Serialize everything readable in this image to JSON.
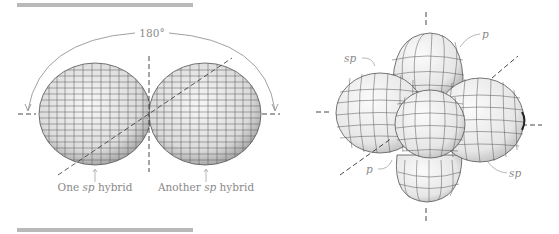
{
  "left_figure": {
    "angle_label": "180°",
    "labels": [
      {
        "prefix": "One ",
        "italic": "sp",
        "suffix": " hybrid"
      },
      {
        "prefix": "Another ",
        "italic": "sp",
        "suffix": " hybrid"
      }
    ]
  },
  "right_figure": {
    "labels": [
      {
        "text": "p",
        "position": "top-right"
      },
      {
        "text": "sp",
        "position": "top-left"
      },
      {
        "text": "p",
        "position": "bottom-left"
      },
      {
        "text": "sp",
        "position": "bottom-right"
      }
    ]
  },
  "colors": {
    "rule": "#b9b9b9",
    "label": "#8a8a8a",
    "mesh": "#555555",
    "lobe_fill": "#ececec"
  }
}
